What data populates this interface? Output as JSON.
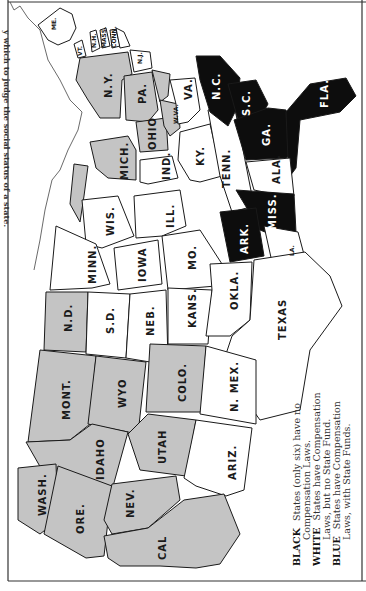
{
  "caption": "y which to judge the social status of a state.",
  "map": {
    "title": "Workmen's Compensation Laws by State",
    "orientation": "rotated 90 degrees (north at left)",
    "colors": {
      "black": "#0d0d0d",
      "white": "#ffffff",
      "blue": "#c4c4c4",
      "border": "#1a1a1a"
    },
    "states": {
      "me": "ME.",
      "vt": "VT.",
      "nh": "N.H.",
      "mass": "MASS.",
      "conn": "CONN.",
      "ri": "R.I.",
      "nj": "N.J.",
      "ny": "N.Y.",
      "pa": "PA.",
      "md": "MD.",
      "del": "DEL.",
      "ohio": "OHIO",
      "wva": "W.VA.",
      "va": "VA.",
      "mich": "MICH.",
      "ind": "IND.",
      "ky": "KY.",
      "nc": "N.C.",
      "sc": "S.C.",
      "ga": "GA.",
      "fla": "FLA.",
      "tenn": "TENN.",
      "ala": "ALA.",
      "miss": "MISS.",
      "ark": "ARK.",
      "la": "LA.",
      "wis": "WIS.",
      "ill": "ILL.",
      "minn": "MINN.",
      "iowa": "IOWA",
      "mo": "MO.",
      "nd": "N.D.",
      "sd": "S.D.",
      "neb": "NEB.",
      "kans": "KANS.",
      "okla": "OKLA.",
      "texas": "TEXAS",
      "mont": "MONT.",
      "wyo": "WYO",
      "colo": "COLO.",
      "nmex": "N. MEX.",
      "idaho": "IDAHO",
      "utah": "UTAH",
      "ariz": "ARIZ.",
      "wash": "WASH.",
      "ore": "ORE.",
      "nev": "NEV.",
      "cal": "CAL"
    },
    "categories": {
      "black": [
        "N.C.",
        "S.C.",
        "GA.",
        "FLA.",
        "MISS.",
        "ARK."
      ],
      "blue": [
        "N.Y.",
        "PA.",
        "OHIO",
        "W.VA.",
        "MICH.",
        "MD.",
        "N.D.",
        "MONT.",
        "WYO",
        "COLO.",
        "IDAHO",
        "UTAH",
        "WASH.",
        "ORE.",
        "NEV.",
        "CAL"
      ],
      "white": [
        "ME.",
        "VT.",
        "N.H.",
        "MASS.",
        "CONN.",
        "R.I.",
        "N.J.",
        "VA.",
        "IND.",
        "KY.",
        "TENN.",
        "ALA.",
        "LA.",
        "WIS.",
        "ILL.",
        "MINN.",
        "IOWA",
        "MO.",
        "S.D.",
        "NEB.",
        "KANS.",
        "OKLA.",
        "TEXAS",
        "N. MEX.",
        "ARIZ."
      ]
    }
  },
  "legend": {
    "black_key": "BLACK",
    "black_text": "States (only six) have no",
    "black_text2": "Compensation Laws.",
    "white_key": "WHITE",
    "white_text": "States have Compensation",
    "white_text2": "Laws, but no State Fund.",
    "blue_key": "BLUE",
    "blue_text": "States have Compensation",
    "blue_text2": "Laws, with State Funds."
  }
}
